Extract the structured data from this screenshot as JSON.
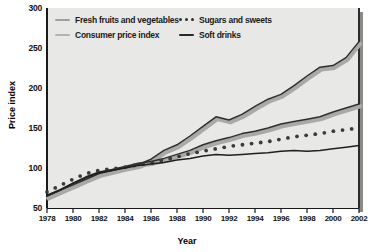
{
  "chart_data": {
    "type": "line",
    "title": "",
    "xlabel": "Year",
    "ylabel": "Price index",
    "xlim": [
      1978,
      2002
    ],
    "ylim": [
      50,
      300
    ],
    "ytick_step": 50,
    "xtick_step": 2,
    "grid": false,
    "legend_position": "top-left-inside",
    "x": [
      1978,
      1979,
      1980,
      1981,
      1982,
      1983,
      1984,
      1985,
      1986,
      1987,
      1988,
      1989,
      1990,
      1991,
      1992,
      1993,
      1994,
      1995,
      1996,
      1997,
      1998,
      1999,
      2000,
      2001,
      2002
    ],
    "yticks": [
      50,
      100,
      150,
      200,
      250,
      300
    ],
    "xticks": [
      1978,
      1980,
      1982,
      1984,
      1986,
      1988,
      1990,
      1992,
      1994,
      1996,
      1998,
      2000,
      2002
    ],
    "series": [
      {
        "name": "Fresh fruits and vegetables",
        "style": "solid",
        "color": "#2e2e2e",
        "halo": "#a9a9a7",
        "values": [
          65,
          72,
          79,
          86,
          93,
          97,
          101,
          104,
          111,
          122,
          129,
          140,
          152,
          164,
          160,
          167,
          177,
          186,
          192,
          203,
          215,
          226,
          228,
          238,
          258
        ]
      },
      {
        "name": "Consumer price index",
        "style": "solid",
        "color": "#2e2e2e",
        "halo": "#a9a9a7",
        "values": [
          65,
          72,
          81,
          89,
          95,
          98,
          102,
          106,
          108,
          112,
          117,
          122,
          129,
          134,
          138,
          143,
          146,
          150,
          155,
          158,
          161,
          164,
          170,
          175,
          180
        ]
      },
      {
        "name": "Sugars and sweets",
        "style": "dotted",
        "color": "#3a3a3a",
        "halo": "none",
        "values": [
          70,
          78,
          86,
          93,
          97,
          99,
          101,
          104,
          106,
          110,
          114,
          118,
          121,
          124,
          127,
          129,
          131,
          133,
          136,
          139,
          141,
          143,
          146,
          148,
          150
        ]
      },
      {
        "name": "Soft drinks",
        "style": "solid",
        "color": "#1f1f1f",
        "halo": "none",
        "values": [
          66,
          73,
          81,
          88,
          94,
          97,
          100,
          103,
          105,
          107,
          110,
          112,
          115,
          117,
          116,
          117,
          118,
          119,
          121,
          122,
          121,
          122,
          124,
          126,
          128
        ]
      }
    ]
  },
  "legend": {
    "items": [
      {
        "label": "Fresh fruits and vegetables",
        "marker": "line-gray-thick",
        "color": "#a0a09e"
      },
      {
        "label": "Sugars and sweets",
        "marker": "dots-dark",
        "color": "#2f2f2f"
      },
      {
        "label": "Consumer price index",
        "marker": "line-gray-light",
        "color": "#b4b4b2"
      },
      {
        "label": "Soft drinks",
        "marker": "line-dark",
        "color": "#2a2a2a"
      }
    ]
  },
  "colors": {
    "plot_background": "#e8e8e6",
    "page_background": "#ffffff",
    "axis": "#1a1a1a",
    "shadow": "#8a8a88"
  }
}
